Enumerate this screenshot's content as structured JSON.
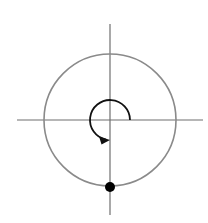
{
  "diagram": {
    "type": "rotation-on-circle",
    "axes": {
      "horizontal": {
        "x1": 17,
        "x2": 203,
        "y": 120,
        "color": "#6f6f6f"
      },
      "vertical": {
        "x": 110,
        "y1": 24,
        "y2": 215,
        "color": "#6f6f6f"
      }
    },
    "circle": {
      "cx": 110,
      "cy": 120,
      "r": 66,
      "color": "#8a8a8a"
    },
    "point": {
      "cx": 110,
      "cy": 187,
      "r": 5,
      "color": "#000000",
      "label": ""
    },
    "rotation_arc": {
      "start_angle_deg": 0,
      "end_angle_deg": 270,
      "direction": "counterclockwise",
      "radius": 20,
      "color": "#111111"
    }
  }
}
